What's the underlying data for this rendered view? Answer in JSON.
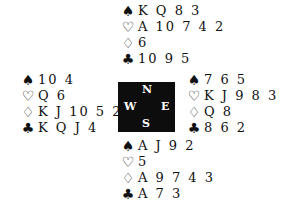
{
  "suits": {
    "spades": "♠",
    "hearts": "♡",
    "diamonds": "♢",
    "clubs": "♣"
  },
  "compass": {
    "north": "N",
    "west": "W",
    "east": "E",
    "south": "S",
    "box_color": "#0d0d0d"
  },
  "hands": {
    "north": {
      "spades": "K Q 8 3",
      "hearts": "A 10 7 4 2",
      "diamonds": "6",
      "clubs": "10 9 5"
    },
    "west": {
      "spades": "10 4",
      "hearts": "Q 6",
      "diamonds": "K J 10 5 2",
      "clubs": "K Q J 4"
    },
    "east": {
      "spades": "7 6 5",
      "hearts": "K J 9 8 3",
      "diamonds": "Q 8",
      "clubs": "8 6 2"
    },
    "south": {
      "spades": "A J 9 2",
      "hearts": "5",
      "diamonds": "A 9 7 4 3",
      "clubs": "A 7 3"
    }
  }
}
